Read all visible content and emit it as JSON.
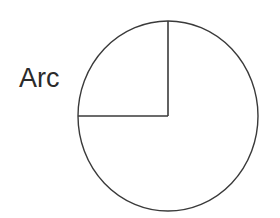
{
  "figure": {
    "name": "arc-diagram",
    "background_color": "#ffffff",
    "width": 280,
    "height": 218,
    "stroke_color": "#3a3a3a",
    "stroke_width": 1.4,
    "label": {
      "text": "Arc",
      "color": "#2b2b2b",
      "font_size_px": 27,
      "x": 19,
      "y": 64
    },
    "circle": {
      "center_x": 168,
      "center_y": 116,
      "radius_x": 90,
      "radius_y": 95,
      "fill": "none"
    },
    "radii": [
      {
        "name": "vertical-radius",
        "from_angle_deg": 90,
        "label_position": "top",
        "x1": 168,
        "y1": 116,
        "x2": 168,
        "y2": 21
      },
      {
        "name": "horizontal-radius",
        "from_angle_deg": 180,
        "label_position": "left",
        "x1": 168,
        "y1": 116,
        "x2": 78,
        "y2": 116
      }
    ],
    "sector": {
      "name": "upper-left-quadrant",
      "start_angle_deg": 90,
      "end_angle_deg": 180,
      "sweep_deg": 90
    }
  }
}
